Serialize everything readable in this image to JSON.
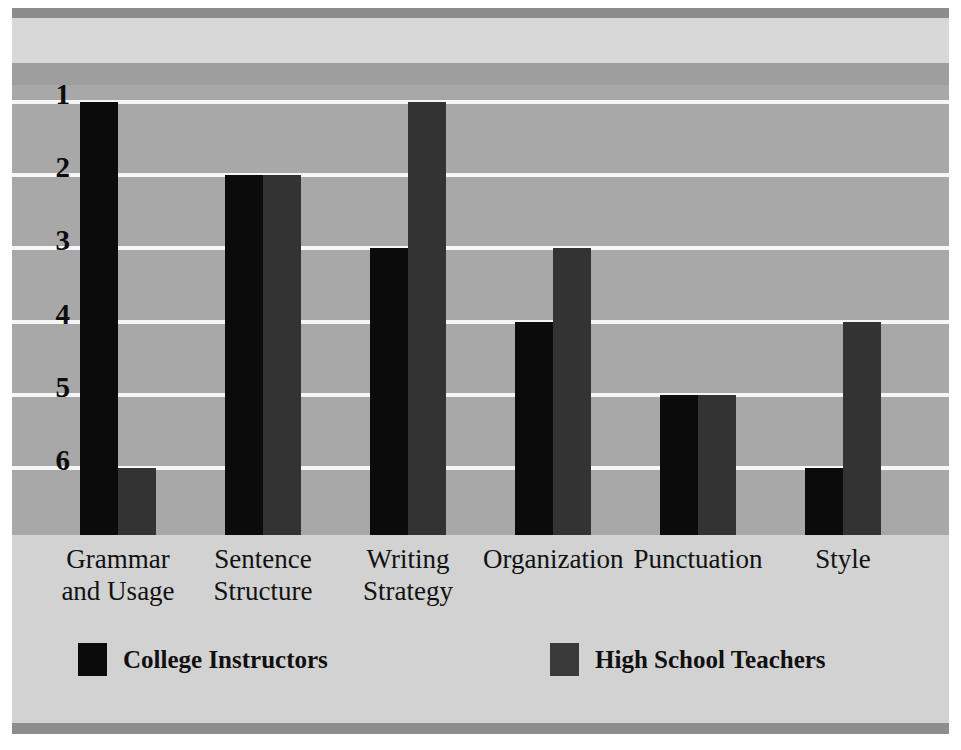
{
  "chart_data": {
    "type": "bar",
    "title": "",
    "subtitle": "",
    "xlabel": "",
    "ylabel": "",
    "orientation": "vertical",
    "grid": true,
    "y_axis_inverted": true,
    "ylim": [
      1,
      6
    ],
    "yticks": [
      1,
      2,
      3,
      4,
      5,
      6
    ],
    "ytick_labels": [
      "1",
      "2",
      "3",
      "4",
      "5",
      "6"
    ],
    "categories": [
      "Grammar and Usage",
      "Sentence Structure",
      "Writing Strategy",
      "Organization",
      "Punctuation",
      "Style"
    ],
    "category_lines": [
      [
        "Grammar",
        "and Usage"
      ],
      [
        "Sentence",
        "Structure"
      ],
      [
        "Writing",
        "Strategy"
      ],
      [
        "Organization"
      ],
      [
        "Punctuation"
      ],
      [
        "Style"
      ]
    ],
    "legend_position": "bottom",
    "series": [
      {
        "name": "College Instructors",
        "color": "#0b0b0b",
        "values": [
          1,
          2,
          3,
          4,
          5,
          6
        ]
      },
      {
        "name": "High School Teachers",
        "color": "#333333",
        "values": [
          6,
          2,
          1,
          3,
          5,
          4
        ]
      }
    ]
  },
  "colors": {
    "plot_background": "#a8a8a8",
    "gridline": "#f6f6f6",
    "band_rule": "#8d8d8d",
    "band_light": "#d8d8d8",
    "band_mid": "#9e9e9e",
    "axis_strip": "#d2d2d2",
    "series_0": "#0b0b0b",
    "series_1": "#333333",
    "text": "#111111"
  }
}
